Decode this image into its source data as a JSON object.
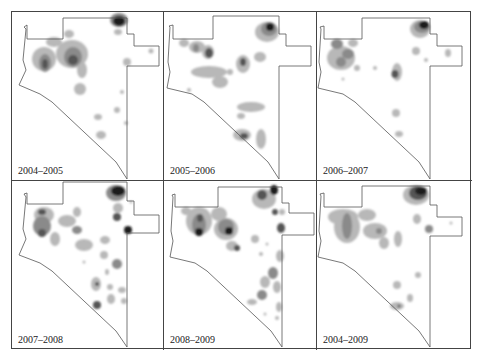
{
  "figure": {
    "layout": {
      "rows": 2,
      "cols": 3
    },
    "colors": {
      "border": "#444444",
      "outline": "#555555",
      "density_low": "#b8b8b8",
      "density_mid": "#8a8a8a",
      "density_high": "#555555",
      "density_peak": "#1e1e1e"
    },
    "panels": [
      {
        "label": "2004–2005"
      },
      {
        "label": "2005–2006"
      },
      {
        "label": "2006–2007"
      },
      {
        "label": "2007–2008"
      },
      {
        "label": "2008–2009"
      },
      {
        "label": "2004–2009"
      }
    ]
  }
}
